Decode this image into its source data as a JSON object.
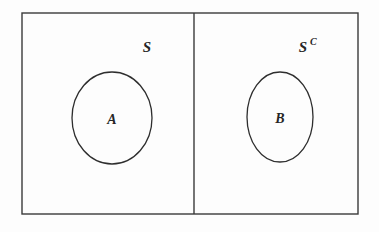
{
  "figure": {
    "type": "venn-diagram",
    "background_color": "#fdfdfd",
    "stroke_color": "#2e2e2e",
    "frame": {
      "x": 22,
      "y": 13,
      "width": 336,
      "height": 201
    },
    "divider": {
      "x": 194,
      "y_top": 13,
      "y_bottom": 214
    }
  },
  "regions": [
    {
      "id": "region-s",
      "label": "S",
      "superscript": "",
      "label_x": 147,
      "label_y": 52
    },
    {
      "id": "region-s-complement",
      "label": "S",
      "superscript": "C",
      "label_x": 303,
      "label_y": 52
    }
  ],
  "sets": [
    {
      "id": "set-a",
      "label": "A",
      "cx": 112,
      "cy": 118,
      "rx": 40,
      "ry": 46,
      "label_x": 112,
      "label_y": 124
    },
    {
      "id": "set-b",
      "label": "B",
      "cx": 280,
      "cy": 117,
      "rx": 33,
      "ry": 45,
      "label_x": 280,
      "label_y": 123
    }
  ]
}
